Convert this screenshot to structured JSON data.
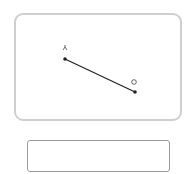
{
  "canvas": {
    "segment": {
      "start": {
        "x": 49,
        "y": 44,
        "label": "人"
      },
      "end": {
        "x": 119,
        "y": 77,
        "label": "o"
      },
      "color": "#222222"
    },
    "border_color": "#cfcfcf"
  },
  "answer_field": {
    "value": "",
    "border_color": "#9a9a9a"
  }
}
